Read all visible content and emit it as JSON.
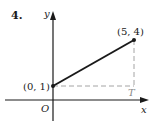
{
  "problem_number": "4.",
  "axes": {
    "x_label": "x",
    "y_label": "y",
    "origin_label": "O"
  },
  "points": [
    {
      "name": "start",
      "label": "(0, 1)",
      "x": 0,
      "y": 1
    },
    {
      "name": "end",
      "label": "(5, 4)",
      "x": 5,
      "y": 4
    }
  ],
  "corner_label": "T",
  "colors": {
    "ink": "#1a1a1a",
    "dashed": "#9a9a9a",
    "corner_label": "#8a8a8a"
  }
}
